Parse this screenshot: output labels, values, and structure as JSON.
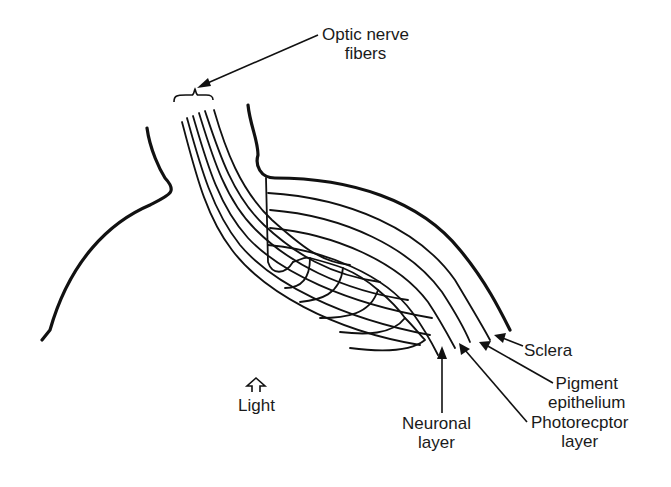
{
  "diagram": {
    "labels": {
      "optic_nerve": [
        "Optic nerve",
        "fibers"
      ],
      "sclera": [
        "Sclera"
      ],
      "pigment": [
        "Pigment",
        "epithelium"
      ],
      "photoreceptor": [
        "Photorecptor",
        "layer"
      ],
      "neuronal": [
        "Neuronal",
        "layer"
      ],
      "light": [
        "Light"
      ]
    },
    "colors": {
      "ink": "#111111",
      "background": "#ffffff"
    }
  }
}
